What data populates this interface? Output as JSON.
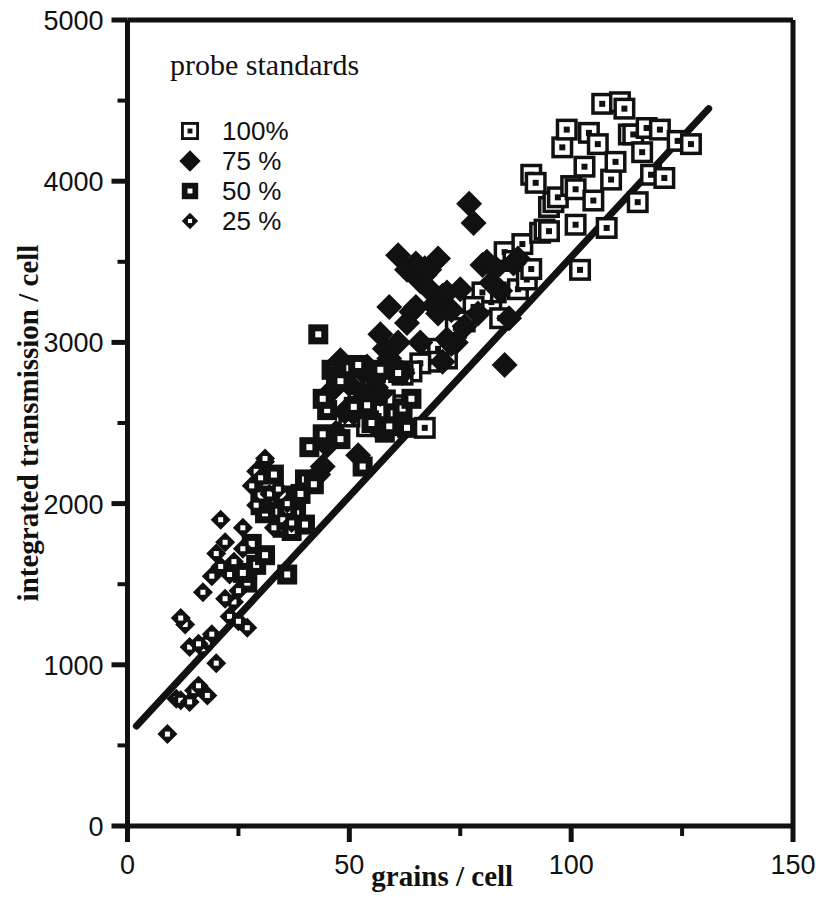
{
  "chart_data": {
    "type": "scatter",
    "title": "",
    "xlabel": "grains / cell",
    "ylabel": "integrated transmission / cell",
    "xlim": [
      0,
      150
    ],
    "ylim": [
      0,
      5000
    ],
    "xticks": [
      0,
      50,
      100,
      150
    ],
    "xticklabels": [
      "0",
      "50",
      "100",
      "150"
    ],
    "xminorticks": [
      25,
      75,
      125
    ],
    "yticks": [
      0,
      1000,
      2000,
      3000,
      4000,
      5000
    ],
    "yticklabels": [
      "0",
      "1000",
      "2000",
      "3000",
      "4000",
      "5000"
    ],
    "yminorticks": [
      500,
      1500,
      2500,
      3500,
      4500
    ],
    "grid": false,
    "legend": {
      "title": "probe standards",
      "position": "upper-left-inside",
      "entries": [
        {
          "label": "100%",
          "marker": "open-square",
          "value": 100
        },
        {
          "label": "75 %",
          "marker": "filled-diamond",
          "value": 75
        },
        {
          "label": "50 %",
          "marker": "filled-square",
          "value": 50
        },
        {
          "label": "25 %",
          "marker": "small-diamond",
          "value": 25
        }
      ]
    },
    "fit_line": {
      "name": "regression line",
      "x": [
        2,
        131
      ],
      "y": [
        620,
        4450
      ]
    },
    "series": [
      {
        "name": "100%",
        "marker": "open-square",
        "points": [
          [
            85,
            3560
          ],
          [
            87,
            3505
          ],
          [
            88,
            3330
          ],
          [
            89,
            3610
          ],
          [
            90,
            3390
          ],
          [
            91,
            3455
          ],
          [
            91,
            4040
          ],
          [
            92,
            3990
          ],
          [
            93,
            3680
          ],
          [
            94,
            3700
          ],
          [
            95,
            3690
          ],
          [
            95,
            3840
          ],
          [
            96,
            3870
          ],
          [
            97,
            3900
          ],
          [
            98,
            4210
          ],
          [
            99,
            4320
          ],
          [
            100,
            3970
          ],
          [
            101,
            3950
          ],
          [
            101,
            3730
          ],
          [
            102,
            3450
          ],
          [
            103,
            4090
          ],
          [
            104,
            4300
          ],
          [
            105,
            3880
          ],
          [
            106,
            4230
          ],
          [
            107,
            4480
          ],
          [
            108,
            3710
          ],
          [
            109,
            4010
          ],
          [
            110,
            4120
          ],
          [
            111,
            4490
          ],
          [
            112,
            4450
          ],
          [
            113,
            4290
          ],
          [
            114,
            4290
          ],
          [
            115,
            3870
          ],
          [
            116,
            4180
          ],
          [
            117,
            4330
          ],
          [
            118,
            4040
          ],
          [
            120,
            4320
          ],
          [
            121,
            4020
          ],
          [
            124,
            4250
          ],
          [
            127,
            4230
          ],
          [
            82,
            3250
          ],
          [
            83,
            3310
          ],
          [
            84,
            3150
          ],
          [
            80,
            3310
          ],
          [
            78,
            3220
          ],
          [
            76,
            3130
          ],
          [
            74,
            3090
          ],
          [
            72,
            2900
          ],
          [
            70,
            2960
          ],
          [
            68,
            2880
          ],
          [
            66,
            2870
          ],
          [
            64,
            2820
          ],
          [
            62,
            2800
          ],
          [
            60,
            2610
          ],
          [
            58,
            2640
          ],
          [
            56,
            2560
          ],
          [
            54,
            2480
          ],
          [
            52,
            2600
          ],
          [
            50,
            2540
          ],
          [
            67,
            2470
          ]
        ]
      },
      {
        "name": "75 %",
        "marker": "filled-diamond",
        "points": [
          [
            47,
            2440
          ],
          [
            49,
            2570
          ],
          [
            51,
            2560
          ],
          [
            53,
            2820
          ],
          [
            54,
            2850
          ],
          [
            55,
            2800
          ],
          [
            56,
            2720
          ],
          [
            57,
            2680
          ],
          [
            58,
            2960
          ],
          [
            59,
            2900
          ],
          [
            60,
            2860
          ],
          [
            61,
            3000
          ],
          [
            62,
            2810
          ],
          [
            63,
            3120
          ],
          [
            64,
            3190
          ],
          [
            65,
            3220
          ],
          [
            66,
            3000
          ],
          [
            66,
            3380
          ],
          [
            67,
            3420
          ],
          [
            68,
            3450
          ],
          [
            68,
            3330
          ],
          [
            69,
            3230
          ],
          [
            70,
            3180
          ],
          [
            70,
            3520
          ],
          [
            71,
            3290
          ],
          [
            72,
            3020
          ],
          [
            72,
            3310
          ],
          [
            73,
            3200
          ],
          [
            74,
            3000
          ],
          [
            75,
            3330
          ],
          [
            76,
            3100
          ],
          [
            77,
            3860
          ],
          [
            78,
            3740
          ],
          [
            79,
            3180
          ],
          [
            80,
            3480
          ],
          [
            81,
            3500
          ],
          [
            82,
            3370
          ],
          [
            83,
            3460
          ],
          [
            84,
            3320
          ],
          [
            85,
            2860
          ],
          [
            86,
            3150
          ],
          [
            87,
            3490
          ],
          [
            88,
            3520
          ],
          [
            45,
            2360
          ],
          [
            46,
            2700
          ],
          [
            48,
            2890
          ],
          [
            50,
            2740
          ],
          [
            52,
            2300
          ],
          [
            53,
            2690
          ],
          [
            61,
            3540
          ],
          [
            63,
            3450
          ],
          [
            65,
            3490
          ],
          [
            67,
            3460
          ],
          [
            59,
            3220
          ],
          [
            57,
            3050
          ],
          [
            44,
            2230
          ],
          [
            43,
            2180
          ],
          [
            56,
            2480
          ],
          [
            71,
            2880
          ],
          [
            73,
            2990
          ]
        ]
      },
      {
        "name": "50 %",
        "marker": "filled-square",
        "points": [
          [
            27,
            1510
          ],
          [
            29,
            1620
          ],
          [
            30,
            1990
          ],
          [
            31,
            1940
          ],
          [
            32,
            2000
          ],
          [
            33,
            2010
          ],
          [
            34,
            1950
          ],
          [
            35,
            1850
          ],
          [
            36,
            1560
          ],
          [
            37,
            1830
          ],
          [
            38,
            1940
          ],
          [
            39,
            2060
          ],
          [
            40,
            2150
          ],
          [
            41,
            2350
          ],
          [
            42,
            2120
          ],
          [
            43,
            3050
          ],
          [
            44,
            2430
          ],
          [
            45,
            2580
          ],
          [
            46,
            2830
          ],
          [
            47,
            2790
          ],
          [
            48,
            2760
          ],
          [
            49,
            2850
          ],
          [
            50,
            2840
          ],
          [
            51,
            2600
          ],
          [
            52,
            2860
          ],
          [
            53,
            2230
          ],
          [
            54,
            2610
          ],
          [
            55,
            2500
          ],
          [
            56,
            2810
          ],
          [
            57,
            2830
          ],
          [
            58,
            2440
          ],
          [
            59,
            2480
          ],
          [
            60,
            2560
          ],
          [
            61,
            2810
          ],
          [
            62,
            2590
          ],
          [
            63,
            2470
          ],
          [
            64,
            2650
          ],
          [
            31,
            1680
          ],
          [
            33,
            2180
          ],
          [
            36,
            1960
          ],
          [
            40,
            1870
          ],
          [
            44,
            2650
          ],
          [
            48,
            2400
          ],
          [
            30,
            2050
          ],
          [
            35,
            2050
          ],
          [
            28,
            1750
          ],
          [
            26,
            1570
          ]
        ]
      },
      {
        "name": "25 %",
        "marker": "small-diamond",
        "points": [
          [
            9,
            570
          ],
          [
            11,
            790
          ],
          [
            12,
            780
          ],
          [
            13,
            1250
          ],
          [
            14,
            1110
          ],
          [
            15,
            840
          ],
          [
            16,
            870
          ],
          [
            17,
            1100
          ],
          [
            18,
            1140
          ],
          [
            19,
            1550
          ],
          [
            20,
            1690
          ],
          [
            21,
            1610
          ],
          [
            21,
            1900
          ],
          [
            22,
            1760
          ],
          [
            23,
            1300
          ],
          [
            24,
            1390
          ],
          [
            25,
            1460
          ],
          [
            26,
            1720
          ],
          [
            27,
            1230
          ],
          [
            28,
            2110
          ],
          [
            29,
            2200
          ],
          [
            30,
            2160
          ],
          [
            31,
            2260
          ],
          [
            32,
            2060
          ],
          [
            33,
            1850
          ],
          [
            34,
            2090
          ],
          [
            35,
            1900
          ],
          [
            36,
            2000
          ],
          [
            17,
            1450
          ],
          [
            19,
            1190
          ],
          [
            20,
            1010
          ],
          [
            22,
            1410
          ],
          [
            24,
            1640
          ],
          [
            26,
            1850
          ],
          [
            14,
            770
          ],
          [
            16,
            1130
          ],
          [
            18,
            810
          ],
          [
            12,
            1290
          ],
          [
            23,
            1560
          ],
          [
            29,
            1990
          ],
          [
            31,
            2280
          ],
          [
            25,
            1270
          ],
          [
            37,
            1880
          ]
        ]
      }
    ]
  }
}
